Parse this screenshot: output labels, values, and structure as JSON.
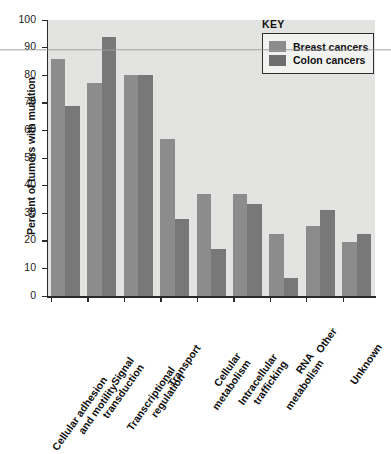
{
  "chart_data": {
    "type": "bar",
    "title": "",
    "xlabel": "",
    "ylabel": "Percent of tumors with mutation",
    "ylim": [
      0,
      100
    ],
    "ytick_step": 10,
    "yticks": [
      0,
      10,
      20,
      30,
      40,
      50,
      60,
      70,
      80,
      90,
      100
    ],
    "grid": false,
    "legend_position": "top-right",
    "legend_title": "KEY",
    "categories": [
      "Cellular adhesion and motility",
      "Signal transduction",
      "Transcriptional regulation",
      "Transport",
      "Cellular metabolism",
      "Intracellular trafficking",
      "RNA metabolism",
      "Other",
      "Unknown"
    ],
    "category_lines": [
      [
        "Cellular adhesion",
        "and motility"
      ],
      [
        "Signal",
        "transduction"
      ],
      [
        "Transcriptional",
        "regulation"
      ],
      [
        "Transport"
      ],
      [
        "Cellular",
        "metabolism"
      ],
      [
        "Intracellular",
        "trafficking"
      ],
      [
        "RNA",
        "metabolism"
      ],
      [
        "Other"
      ],
      [
        "Unknown"
      ]
    ],
    "series": [
      {
        "name": "Breast cancers",
        "color": "#8c8c8c",
        "values": [
          86,
          77,
          80,
          57,
          37,
          37,
          22.5,
          25.5,
          19.5
        ]
      },
      {
        "name": "Colon cancers",
        "color": "#787878",
        "values": [
          69,
          94,
          80,
          28,
          17,
          33.5,
          6.5,
          31,
          22.5
        ]
      }
    ]
  }
}
